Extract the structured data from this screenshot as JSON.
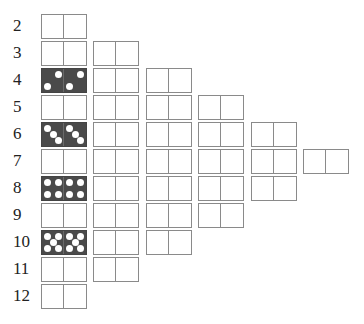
{
  "diagram": {
    "rows": [
      {
        "label": "2",
        "count": 1,
        "highlight": null
      },
      {
        "label": "3",
        "count": 2,
        "highlight": null
      },
      {
        "label": "4",
        "count": 3,
        "highlight": {
          "pips": 2
        }
      },
      {
        "label": "5",
        "count": 4,
        "highlight": null
      },
      {
        "label": "6",
        "count": 5,
        "highlight": {
          "pips": 3
        }
      },
      {
        "label": "7",
        "count": 6,
        "highlight": null
      },
      {
        "label": "8",
        "count": 5,
        "highlight": {
          "pips": 4
        }
      },
      {
        "label": "9",
        "count": 4,
        "highlight": null
      },
      {
        "label": "10",
        "count": 3,
        "highlight": {
          "pips": 5
        }
      },
      {
        "label": "11",
        "count": 2,
        "highlight": null
      },
      {
        "label": "12",
        "count": 1,
        "highlight": null
      }
    ]
  },
  "colors": {
    "border": "#8a8a8a",
    "dark_fill": "#4a4a4a",
    "pip": "#ffffff"
  }
}
